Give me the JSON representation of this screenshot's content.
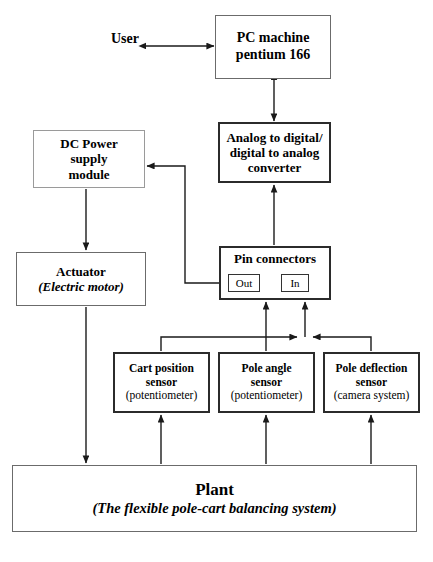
{
  "diagram": {
    "user_label": "User",
    "nodes": {
      "pc_machine": {
        "line1": "PC machine",
        "line2": "pentium 166"
      },
      "converter": {
        "line1": "Analog to digital/",
        "line2": "digital to analog",
        "line3": "converter"
      },
      "dc_power": {
        "line1": "DC Power",
        "line2": "supply",
        "line3": "module"
      },
      "actuator": {
        "line1": "Actuator",
        "line2": "(Electric motor)"
      },
      "pin_connectors": {
        "title": "Pin connectors",
        "out_label": "Out",
        "in_label": "In"
      },
      "sensor_cart_position": {
        "line1": "Cart position",
        "line2": "sensor",
        "line3": "(potentiometer)"
      },
      "sensor_pole_angle": {
        "line1": "Pole angle",
        "line2": "sensor",
        "line3": "(potentiometer)"
      },
      "sensor_pole_deflection": {
        "line1": "Pole deflection",
        "line2": "sensor",
        "line3": "(camera system)"
      },
      "plant": {
        "line1": "Plant",
        "line2": "(The flexible pole-cart balancing system)"
      }
    },
    "colors": {
      "background": "#ffffff",
      "text": "#000000",
      "wire": "#1a1a1a",
      "border_thin": "#9a9a9a",
      "border_medium": "#6b6b6b",
      "border_thick": "#2b2b2b"
    }
  }
}
